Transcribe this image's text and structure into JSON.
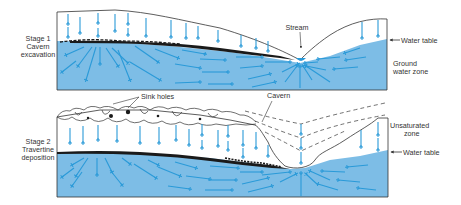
{
  "colors": {
    "groundwater": "#7dbde6",
    "arrow": "#2a9ad8",
    "outline": "#333333",
    "travertine": "#1a1a1a"
  },
  "stage1": {
    "label_line1": "Stage 1",
    "label_line2": "Cavern",
    "label_line3": "excavation",
    "stream_label": "Stream",
    "water_table_label": "Water table",
    "zone_label_line1": "Ground",
    "zone_label_line2": "water zone"
  },
  "stage2": {
    "label_line1": "Stage 2",
    "label_line2": "Travertine",
    "label_line3": "deposition",
    "sink_holes_label": "Sink holes",
    "cavern_label": "Cavern",
    "unsaturated_label_line1": "Unsaturated",
    "unsaturated_label_line2": "zone",
    "water_table_label": "Water table"
  }
}
